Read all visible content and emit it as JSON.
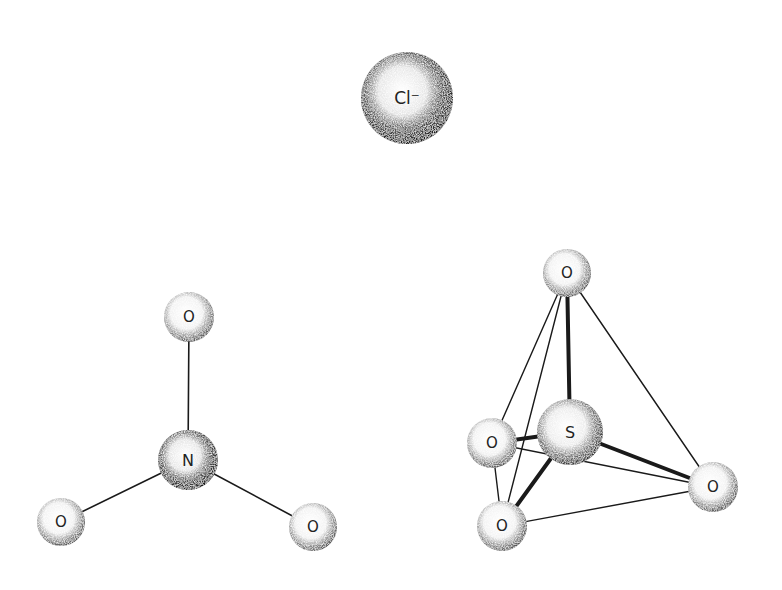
{
  "diagram": {
    "type": "molecular-structure-models",
    "background": "#ffffff",
    "ink": "#1a1a1a",
    "molecules": [
      {
        "id": "chloride",
        "name": "Chloride ion",
        "atoms": [
          {
            "id": "cl",
            "label": "Cl⁻",
            "x": 407,
            "y": 98,
            "r": 46,
            "shade": "dark"
          }
        ],
        "bonds": []
      },
      {
        "id": "nitrate",
        "name": "Nitrate (trigonal planar)",
        "atoms": [
          {
            "id": "n",
            "label": "N",
            "x": 188,
            "y": 460,
            "r": 30,
            "shade": "dark"
          },
          {
            "id": "o1",
            "label": "O",
            "x": 189,
            "y": 317,
            "r": 25,
            "shade": "light"
          },
          {
            "id": "o2",
            "label": "O",
            "x": 61,
            "y": 522,
            "r": 24,
            "shade": "light"
          },
          {
            "id": "o3",
            "label": "O",
            "x": 313,
            "y": 527,
            "r": 24,
            "shade": "light"
          }
        ],
        "bonds": [
          {
            "from": "n",
            "to": "o1",
            "width": 1.6
          },
          {
            "from": "n",
            "to": "o2",
            "width": 1.6
          },
          {
            "from": "n",
            "to": "o3",
            "width": 1.6
          }
        ]
      },
      {
        "id": "sulfate",
        "name": "Sulfate (tetrahedral)",
        "atoms": [
          {
            "id": "s",
            "label": "S",
            "x": 570,
            "y": 432,
            "r": 33,
            "shade": "medium"
          },
          {
            "id": "ot",
            "label": "O",
            "x": 567,
            "y": 273,
            "r": 24,
            "shade": "light"
          },
          {
            "id": "ol",
            "label": "O",
            "x": 492,
            "y": 443,
            "r": 25,
            "shade": "light"
          },
          {
            "id": "ob",
            "label": "O",
            "x": 502,
            "y": 526,
            "r": 25,
            "shade": "light"
          },
          {
            "id": "or",
            "label": "O",
            "x": 713,
            "y": 487,
            "r": 25,
            "shade": "light"
          }
        ],
        "bonds": [
          {
            "from": "s",
            "to": "ot",
            "width": 4
          },
          {
            "from": "s",
            "to": "ol",
            "width": 4
          },
          {
            "from": "s",
            "to": "ob",
            "width": 4
          },
          {
            "from": "s",
            "to": "or",
            "width": 4
          }
        ],
        "edges": [
          {
            "from": "ot",
            "to": "ol",
            "width": 1.4
          },
          {
            "from": "ot",
            "to": "ob",
            "width": 1.4
          },
          {
            "from": "ot",
            "to": "or",
            "width": 1.4
          },
          {
            "from": "ol",
            "to": "ob",
            "width": 1.4
          },
          {
            "from": "ol",
            "to": "or",
            "width": 1.4
          },
          {
            "from": "ob",
            "to": "or",
            "width": 1.4
          }
        ]
      }
    ]
  }
}
